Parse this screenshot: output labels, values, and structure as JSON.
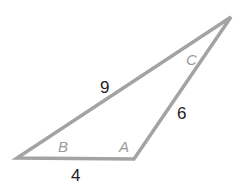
{
  "diagram": {
    "type": "triangle",
    "stroke_color": "#a3a3a3",
    "vertices": {
      "A": {
        "label": "A",
        "x": 134,
        "y": 159
      },
      "B": {
        "label": "B",
        "x": 17,
        "y": 158
      },
      "C": {
        "label": "C",
        "x": 231,
        "y": 17
      }
    },
    "sides": {
      "AB": {
        "label": "4"
      },
      "BC": {
        "label": "9"
      },
      "AC": {
        "label": "6"
      }
    }
  }
}
